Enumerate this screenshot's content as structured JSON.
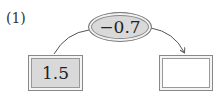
{
  "problem_label": "(1)",
  "operator": {
    "value": "−0.7",
    "fill": "#d9d9d9"
  },
  "input_box": {
    "value": "1.5",
    "fill": "#d9d9d9"
  },
  "output_box": {
    "value": "",
    "fill": "#ffffff"
  }
}
